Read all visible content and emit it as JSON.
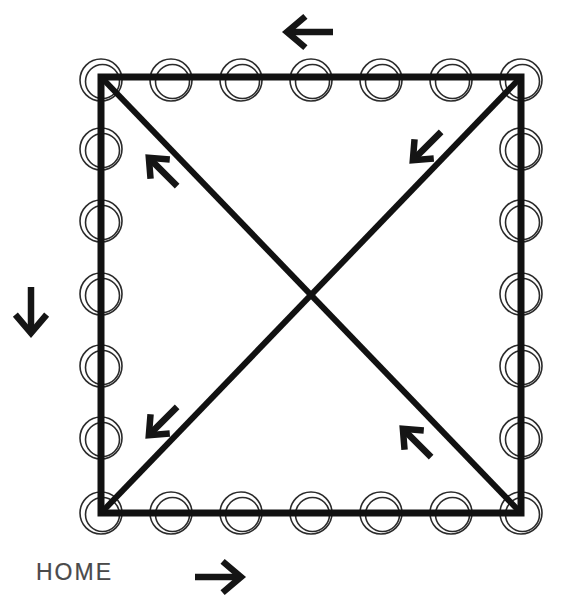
{
  "diagram": {
    "title": "HOME",
    "type": "floor-plan-path-diagram",
    "colors": {
      "background": "#ffffff",
      "wall": "#111111",
      "column_ring": "#2b2b2b",
      "arrow": "#151515",
      "label_text": "#4a4a4a"
    },
    "label": {
      "home_text": "HOME"
    },
    "room": {
      "name": "square-room",
      "left": 101,
      "top": 77,
      "right": 521,
      "bottom": 513,
      "wall_thickness": 7,
      "center_x": 311,
      "center_y": 295
    },
    "columns": {
      "name": "perimeter-columns",
      "count_per_edge": 7,
      "total_unique": 24,
      "outer_radius": 21,
      "inner_radius": 17,
      "ring_stroke": 1.6,
      "top_edge": [
        {
          "cx": 101,
          "cy": 80
        },
        {
          "cx": 171,
          "cy": 80
        },
        {
          "cx": 241,
          "cy": 80
        },
        {
          "cx": 311,
          "cy": 80
        },
        {
          "cx": 381,
          "cy": 80
        },
        {
          "cx": 451,
          "cy": 80
        },
        {
          "cx": 521,
          "cy": 80
        }
      ],
      "bottom_edge": [
        {
          "cx": 101,
          "cy": 513
        },
        {
          "cx": 171,
          "cy": 513
        },
        {
          "cx": 241,
          "cy": 513
        },
        {
          "cx": 311,
          "cy": 513
        },
        {
          "cx": 381,
          "cy": 513
        },
        {
          "cx": 451,
          "cy": 513
        },
        {
          "cx": 521,
          "cy": 513
        }
      ],
      "left_edge": [
        {
          "cx": 101,
          "cy": 149
        },
        {
          "cx": 101,
          "cy": 221
        },
        {
          "cx": 101,
          "cy": 294
        },
        {
          "cx": 101,
          "cy": 366
        },
        {
          "cx": 101,
          "cy": 438
        }
      ],
      "right_edge": [
        {
          "cx": 521,
          "cy": 149
        },
        {
          "cx": 521,
          "cy": 221
        },
        {
          "cx": 521,
          "cy": 294
        },
        {
          "cx": 521,
          "cy": 366
        },
        {
          "cx": 521,
          "cy": 438
        }
      ]
    },
    "diagonals": [
      {
        "name": "diagonal-tl-br",
        "x1": 101,
        "y1": 77,
        "x2": 521,
        "y2": 513
      },
      {
        "name": "diagonal-tr-bl",
        "x1": 521,
        "y1": 77,
        "x2": 101,
        "y2": 513
      }
    ],
    "arrows": [
      {
        "name": "arrow-top-left",
        "direction": "left",
        "symbol": "←",
        "x": 310,
        "y": 32,
        "rotation": 180,
        "length": 46
      },
      {
        "name": "arrow-side-down",
        "direction": "down",
        "symbol": "↓",
        "x": 31,
        "y": 310,
        "rotation": 90,
        "length": 46
      },
      {
        "name": "arrow-bottom-right",
        "direction": "right",
        "symbol": "→",
        "x": 218,
        "y": 577,
        "rotation": 0,
        "length": 46
      },
      {
        "name": "arrow-diag-upper-right",
        "direction": "down-left",
        "symbol": "↙",
        "x": 427,
        "y": 146,
        "rotation": 135,
        "length": 40
      },
      {
        "name": "arrow-diag-upper-left",
        "direction": "up-left",
        "symbol": "↖",
        "x": 163,
        "y": 172,
        "rotation": 225,
        "length": 40
      },
      {
        "name": "arrow-diag-lower-left",
        "direction": "down-left",
        "symbol": "↙",
        "x": 163,
        "y": 421,
        "rotation": 135,
        "length": 40
      },
      {
        "name": "arrow-diag-lower-right",
        "direction": "up-left",
        "symbol": "↖",
        "x": 417,
        "y": 443,
        "rotation": 225,
        "length": 40
      }
    ]
  }
}
